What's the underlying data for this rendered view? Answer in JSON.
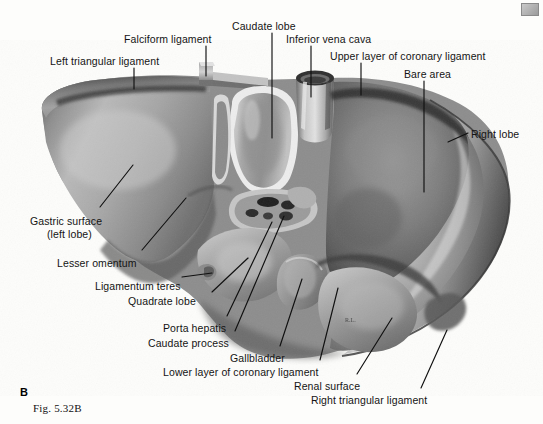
{
  "figure": {
    "panel_letter": "B",
    "caption": "Fig. 5.32B",
    "background_color": "#fdfdfb",
    "ink_color": "#141414"
  },
  "labels": [
    {
      "id": "falciform-ligament",
      "text": "Falciform ligament",
      "x": 124,
      "y": 33,
      "align": "left"
    },
    {
      "id": "caudate-lobe",
      "text": "Caudate lobe",
      "x": 232,
      "y": 20,
      "align": "left"
    },
    {
      "id": "inferior-vena-cava",
      "text": "Inferior vena cava",
      "x": 286,
      "y": 33,
      "align": "left"
    },
    {
      "id": "upper-layer-coronary-ligament",
      "text": "Upper layer of coronary ligament",
      "x": 330,
      "y": 50,
      "align": "left"
    },
    {
      "id": "left-triangular-ligament",
      "text": "Left triangular ligament",
      "x": 50,
      "y": 55,
      "align": "left"
    },
    {
      "id": "bare-area",
      "text": "Bare area",
      "x": 404,
      "y": 68,
      "align": "left"
    },
    {
      "id": "right-lobe",
      "text": "Right lobe",
      "x": 471,
      "y": 128,
      "align": "left"
    },
    {
      "id": "gastric-surface",
      "text": "Gastric surface",
      "x": 30,
      "y": 215,
      "align": "left"
    },
    {
      "id": "gastric-surface-sub",
      "text": "(left lobe)",
      "x": 47,
      "y": 228,
      "align": "left"
    },
    {
      "id": "lesser-omentum",
      "text": "Lesser omentum",
      "x": 57,
      "y": 257,
      "align": "left"
    },
    {
      "id": "ligamentum-teres",
      "text": "Ligamentum teres",
      "x": 95,
      "y": 280,
      "align": "left"
    },
    {
      "id": "quadrate-lobe",
      "text": "Quadrate lobe",
      "x": 128,
      "y": 295,
      "align": "left"
    },
    {
      "id": "porta-hepatis",
      "text": "Porta hepatis",
      "x": 163,
      "y": 322,
      "align": "left"
    },
    {
      "id": "caudate-process",
      "text": "Caudate process",
      "x": 148,
      "y": 337,
      "align": "left"
    },
    {
      "id": "gallbladder",
      "text": "Gallbladder",
      "x": 230,
      "y": 352,
      "align": "left"
    },
    {
      "id": "lower-layer-coronary-ligament",
      "text": "Lower layer of coronary ligament",
      "x": 163,
      "y": 366,
      "align": "left"
    },
    {
      "id": "renal-surface",
      "text": "Renal surface",
      "x": 294,
      "y": 380,
      "align": "left"
    },
    {
      "id": "right-triangular-ligament",
      "text": "Right triangular ligament",
      "x": 311,
      "y": 394,
      "align": "left"
    }
  ],
  "leaders": [
    {
      "id": "leader-falciform-ligament",
      "points": "206,46 206,76"
    },
    {
      "id": "leader-caudate-lobe",
      "points": "272,33 272,138"
    },
    {
      "id": "leader-inferior-vena-cava",
      "points": "311,46 311,97"
    },
    {
      "id": "leader-upper-layer-coronary-ligament",
      "points": "361,63 361,95"
    },
    {
      "id": "leader-left-triangular-ligament",
      "points": "134,68 134,89"
    },
    {
      "id": "leader-bare-area",
      "points": "424,81 424,192"
    },
    {
      "id": "leader-right-lobe",
      "points": "468,133 448,142"
    },
    {
      "id": "leader-gastric-surface",
      "points": "100,207 133,165"
    },
    {
      "id": "leader-lesser-omentum",
      "points": "142,250 186,198"
    },
    {
      "id": "leader-ligamentum-teres",
      "points": "182,277 212,273"
    },
    {
      "id": "leader-quadrate-lobe",
      "points": "212,292 248,258"
    },
    {
      "id": "leader-porta-hepatis",
      "points": "227,316 272,222"
    },
    {
      "id": "leader-caudate-process",
      "points": "235,331 284,216"
    },
    {
      "id": "leader-gallbladder",
      "points": "280,346 302,279"
    },
    {
      "id": "leader-lower-layer-coronary-ligament",
      "points": "320,360 338,288"
    },
    {
      "id": "leader-renal-surface",
      "points": "357,374 392,318"
    },
    {
      "id": "leader-right-triangular-ligament",
      "points": "421,388 447,330"
    }
  ],
  "artwork": {
    "signature_mark": "R.L.",
    "signature_x": 345,
    "signature_y": 322,
    "structures": [
      "left lobe / gastric surface",
      "falciform ligament flap",
      "caudate lobe",
      "inferior vena cava tube",
      "bare area",
      "right lobe",
      "porta hepatis with vessel openings",
      "quadrate lobe",
      "gallbladder fossa",
      "renal surface",
      "coronary ligament layers"
    ]
  }
}
